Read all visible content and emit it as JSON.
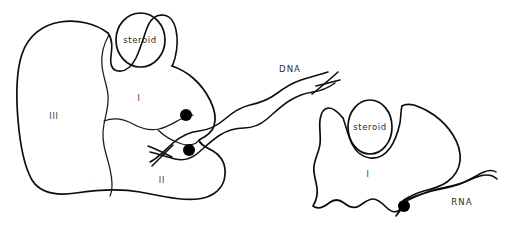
{
  "figure": {
    "name": "steroid-receptor-nucleic-acid-binding-diagram",
    "background_color": "#ffffff",
    "line_color": "#0d0d0d",
    "dot_color": "#000000",
    "width": 508,
    "height": 234
  },
  "left_complex": {
    "name": "steroid-receptor-dna-complex",
    "ligand_label": "steroid",
    "domains": [
      {
        "id": "domain-I",
        "label": "I"
      },
      {
        "id": "domain-II",
        "label": "II"
      },
      {
        "id": "domain-III",
        "label": "III"
      }
    ],
    "nucleic_acid": {
      "label": "DNA",
      "type": "double-helix"
    },
    "binding_sites": [
      {
        "id": "binding-site-upper"
      },
      {
        "id": "binding-site-lower"
      }
    ]
  },
  "right_complex": {
    "name": "steroid-receptor-rna-complex",
    "ligand_label": "steroid",
    "domains": [
      {
        "id": "domain-I",
        "label": "I"
      }
    ],
    "nucleic_acid": {
      "label": "RNA",
      "type": "single-strand"
    },
    "binding_sites": [
      {
        "id": "binding-site-rna"
      }
    ]
  }
}
